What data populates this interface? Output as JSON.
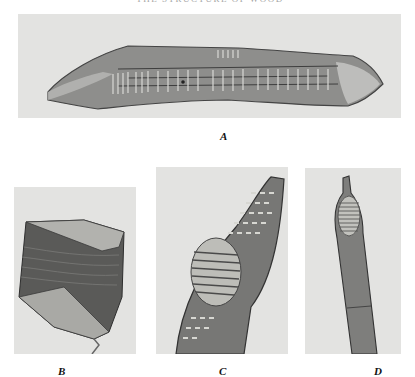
{
  "page": {
    "running_header": "THE STRUCTURE OF WOOD",
    "page_number": ""
  },
  "figure": {
    "panels": [
      {
        "id": "A",
        "label": "A",
        "subject": "elongated wood tracheid cell with bordered pits, horizontal"
      },
      {
        "id": "B",
        "label": "B",
        "subject": "short fragment of wood fiber cell, dark banded"
      },
      {
        "id": "C",
        "label": "C",
        "subject": "tapered cell tip with pitted wall and large scalariform perforation"
      },
      {
        "id": "D",
        "label": "D",
        "subject": "narrow vessel element with tail and scalariform plate"
      }
    ]
  },
  "colors": {
    "panel_background": "#e3e3e1",
    "cell_dark": "#555555",
    "cell_mid": "#8a8a88",
    "pit_light": "#d8d8d4"
  }
}
